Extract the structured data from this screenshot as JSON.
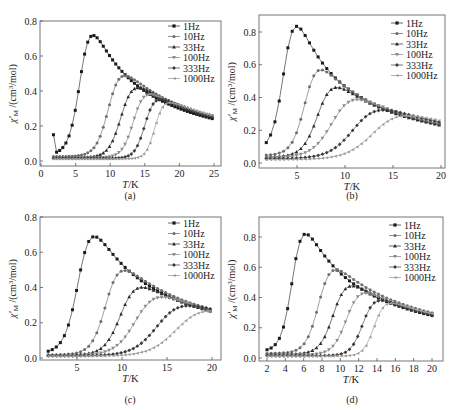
{
  "figure": {
    "ylabel": "χ′M /(cm³/mol)",
    "xlabel": "T/K",
    "legend": [
      "1Hz",
      "10Hz",
      "33Hz",
      "100Hz",
      "333Hz",
      "1000Hz"
    ],
    "series_colors": [
      "#1a1a1a",
      "#6e6e6e",
      "#2a2a2a",
      "#8a8a8a",
      "#3a3a3a",
      "#9a9a9a"
    ],
    "line_colors": [
      "#555555",
      "#888888",
      "#555555",
      "#999999",
      "#666666",
      "#aaaaaa"
    ]
  },
  "chart_data": [
    {
      "type": "line",
      "label": "(a)",
      "xlabel": "T/K",
      "ylabel": "χ′M /(cm³/mol)",
      "xlim": [
        0,
        25.5
      ],
      "ylim": [
        -0.02,
        0.8
      ],
      "xticks": [
        0,
        5,
        10,
        15,
        20,
        25
      ],
      "yticks": [
        0.0,
        0.2,
        0.4,
        0.6,
        0.8
      ],
      "ytick_labels": [
        "0.0",
        "0.2",
        "0.4",
        "0.6",
        "0.8"
      ],
      "frame": {
        "x": 40,
        "y": 21,
        "w": 181,
        "h": 145
      },
      "pix": {
        "x0": 41,
        "x1": 214,
        "t0": 0,
        "t1": 25,
        "y0": 161,
        "y1": 21,
        "v0": 0,
        "v1": 0.8
      },
      "caption_pos": {
        "x": 130,
        "y": 199
      },
      "legend_pos": {
        "x": 168,
        "y": 21
      },
      "t_range": [
        1.8,
        25
      ],
      "step": 0.45,
      "tail": {
        "A": 6.5,
        "theta": 0.0
      },
      "series": [
        {
          "name": "1Hz",
          "peak_T": 8.1,
          "peak_v": 0.74,
          "width": 1.0,
          "base": 0.03
        },
        {
          "name": "10Hz",
          "peak_T": 12.5,
          "peak_v": 0.51,
          "width": 1.15,
          "base": 0.025
        },
        {
          "name": "33Hz",
          "peak_T": 14.3,
          "peak_v": 0.44,
          "width": 1.15,
          "base": 0.02
        },
        {
          "name": "100Hz",
          "peak_T": 15.8,
          "peak_v": 0.4,
          "width": 1.05,
          "base": 0.018
        },
        {
          "name": "333Hz",
          "peak_T": 17.2,
          "peak_v": 0.37,
          "width": 0.95,
          "base": 0.015
        },
        {
          "name": "1000Hz",
          "peak_T": 18.4,
          "peak_v": 0.35,
          "width": 0.85,
          "base": 0.012
        }
      ]
    },
    {
      "type": "line",
      "label": "(b)",
      "xlabel": "T/K",
      "ylabel": "χ′M /(cm³/mol)",
      "xlim": [
        1,
        20.3
      ],
      "ylim": [
        -0.02,
        0.92
      ],
      "xticks": [
        5,
        10,
        15,
        20
      ],
      "yticks": [
        0.0,
        0.2,
        0.4,
        0.6,
        0.8
      ],
      "ytick_labels": [
        "0.0",
        "0.2",
        "0.4",
        "0.6",
        "0.8"
      ],
      "frame": {
        "x": 259,
        "y": 15,
        "w": 186,
        "h": 153
      },
      "pix": {
        "x0": 297,
        "x1": 441,
        "t0": 5,
        "t1": 20,
        "y0": 163,
        "y1": 32,
        "v0": 0,
        "v1": 0.8
      },
      "caption_pos": {
        "x": 352,
        "y": 199
      },
      "legend_pos": {
        "x": 391,
        "y": 18
      },
      "t_range": [
        1.8,
        20
      ],
      "step": 0.45,
      "tail": {
        "A": 5.4,
        "theta": 0.0
      },
      "series": [
        {
          "name": "1Hz",
          "peak_T": 5.5,
          "peak_v": 0.85,
          "width": 0.75,
          "base": 0.06
        },
        {
          "name": "10Hz",
          "peak_T": 7.9,
          "peak_v": 0.59,
          "width": 0.85,
          "base": 0.045
        },
        {
          "name": "33Hz",
          "peak_T": 9.6,
          "peak_v": 0.48,
          "width": 1.0,
          "base": 0.035
        },
        {
          "name": "100Hz",
          "peak_T": 12.0,
          "peak_v": 0.4,
          "width": 1.35,
          "base": 0.03
        },
        {
          "name": "333Hz",
          "peak_T": 14.8,
          "peak_v": 0.335,
          "width": 1.6,
          "base": 0.025
        },
        {
          "name": "1000Hz",
          "peak_T": 17.3,
          "peak_v": 0.3,
          "width": 1.8,
          "base": 0.02
        }
      ]
    },
    {
      "type": "line",
      "label": "(c)",
      "xlabel": "T/K",
      "ylabel": "χ′M /(cm³/mol)",
      "xlim": [
        1,
        20.8
      ],
      "ylim": [
        -0.02,
        0.8
      ],
      "xticks": [
        5,
        10,
        15,
        20
      ],
      "yticks": [
        0.0,
        0.2,
        0.4,
        0.6,
        0.8
      ],
      "ytick_labels": [
        "0.0",
        "0.2",
        "0.4",
        "0.6",
        "0.8"
      ],
      "frame": {
        "x": 40,
        "y": 217,
        "w": 181,
        "h": 143
      },
      "pix": {
        "x0": 77,
        "x1": 212,
        "t0": 5,
        "t1": 20,
        "y0": 358,
        "y1": 217,
        "v0": 0,
        "v1": 0.8
      },
      "caption_pos": {
        "x": 130,
        "y": 403
      },
      "legend_pos": {
        "x": 168,
        "y": 218
      },
      "t_range": [
        1.8,
        20
      ],
      "step": 0.45,
      "tail": {
        "A": 5.8,
        "theta": 0.0
      },
      "series": [
        {
          "name": "1Hz",
          "peak_T": 7.5,
          "peak_v": 0.71,
          "width": 0.95,
          "base": 0.02
        },
        {
          "name": "10Hz",
          "peak_T": 10.6,
          "peak_v": 0.52,
          "width": 1.0,
          "base": 0.018
        },
        {
          "name": "33Hz",
          "peak_T": 12.6,
          "peak_v": 0.42,
          "width": 1.15,
          "base": 0.016
        },
        {
          "name": "100Hz",
          "peak_T": 15.0,
          "peak_v": 0.36,
          "width": 1.45,
          "base": 0.014
        },
        {
          "name": "333Hz",
          "peak_T": 18.0,
          "peak_v": 0.31,
          "width": 1.7,
          "base": 0.012
        },
        {
          "name": "1000Hz",
          "peak_T": 20.6,
          "peak_v": 0.28,
          "width": 1.9,
          "base": 0.01
        }
      ]
    },
    {
      "type": "line",
      "label": "(d)",
      "xlabel": "T/K",
      "ylabel": "χ′M /(cm³/mol)",
      "xlim": [
        1.2,
        20.9
      ],
      "ylim": [
        -0.02,
        0.93
      ],
      "xticks": [
        2,
        4,
        6,
        8,
        10,
        12,
        14,
        16,
        18,
        20
      ],
      "yticks": [
        0.0,
        0.2,
        0.4,
        0.6,
        0.8
      ],
      "ytick_labels": [
        "0.0",
        "0.2",
        "0.4",
        "0.6",
        "0.8"
      ],
      "frame": {
        "x": 259,
        "y": 217,
        "w": 184,
        "h": 144
      },
      "pix": {
        "x0": 267,
        "x1": 432,
        "t0": 2,
        "t1": 20,
        "y0": 358,
        "y1": 237,
        "v0": 0,
        "v1": 0.8
      },
      "caption_pos": {
        "x": 352,
        "y": 403
      },
      "legend_pos": {
        "x": 389,
        "y": 220
      },
      "t_range": [
        2,
        20
      ],
      "step": 0.45,
      "tail": {
        "A": 6.0,
        "theta": 0.0
      },
      "series": [
        {
          "name": "1Hz",
          "peak_T": 6.6,
          "peak_v": 0.85,
          "width": 0.75,
          "base": 0.04
        },
        {
          "name": "10Hz",
          "peak_T": 9.8,
          "peak_v": 0.61,
          "width": 0.9,
          "base": 0.03
        },
        {
          "name": "33Hz",
          "peak_T": 11.5,
          "peak_v": 0.5,
          "width": 0.95,
          "base": 0.025
        },
        {
          "name": "100Hz",
          "peak_T": 12.9,
          "peak_v": 0.45,
          "width": 0.95,
          "base": 0.02
        },
        {
          "name": "333Hz",
          "peak_T": 14.4,
          "peak_v": 0.4,
          "width": 0.85,
          "base": 0.015
        },
        {
          "name": "1000Hz",
          "peak_T": 15.4,
          "peak_v": 0.38,
          "width": 0.75,
          "base": 0.012
        }
      ]
    }
  ]
}
